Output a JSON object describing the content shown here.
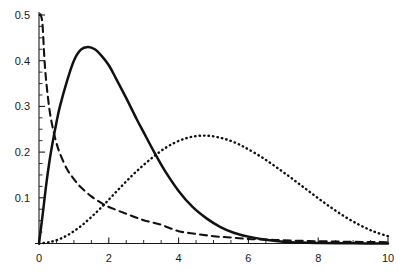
{
  "chart_data": {
    "type": "line",
    "title": "",
    "subtitle": "",
    "xlabel": "",
    "ylabel": "",
    "xlim": [
      0,
      10
    ],
    "ylim": [
      0,
      0.5
    ],
    "grid": false,
    "legend": "none",
    "x_ticks": [
      0,
      2,
      4,
      6,
      8,
      10
    ],
    "x_tick_labels": [
      "0",
      "2",
      "4",
      "6",
      "8",
      "10"
    ],
    "x_minor_step": 0.5,
    "y_ticks": [
      0.1,
      0.2,
      0.3,
      0.4,
      0.5
    ],
    "y_tick_labels": [
      "0.1",
      "0.2",
      "0.3",
      "0.4",
      "0.5"
    ],
    "y_minor_step": 0.025,
    "series": [
      {
        "name": "chi-squared k=1",
        "style": "dashed",
        "color": "#111111",
        "x": [
          0.02,
          0.05,
          0.1,
          0.15,
          0.2,
          0.3,
          0.4,
          0.5,
          0.6,
          0.8,
          1.0,
          1.2,
          1.5,
          1.8,
          2.0,
          2.5,
          3.0,
          3.5,
          4.0,
          4.5,
          5.0,
          5.5,
          6.0,
          6.5,
          7.0,
          7.5,
          8.0,
          8.5,
          9.0,
          9.5,
          10.0
        ],
        "y": [
          0.5,
          0.5,
          0.48,
          0.411,
          0.36,
          0.293,
          0.251,
          0.22,
          0.197,
          0.163,
          0.141,
          0.123,
          0.103,
          0.088,
          0.08,
          0.065,
          0.051,
          0.041,
          0.027,
          0.021,
          0.016,
          0.013,
          0.01,
          0.0085,
          0.007,
          0.0058,
          0.0049,
          0.0042,
          0.0036,
          0.0031,
          0.0028
        ]
      },
      {
        "name": "chi-squared k=3 (scaled)",
        "style": "solid",
        "color": "#111111",
        "x": [
          0.0,
          0.1,
          0.2,
          0.3,
          0.4,
          0.5,
          0.6,
          0.8,
          1.0,
          1.2,
          1.4,
          1.6,
          1.8,
          2.0,
          2.2,
          2.5,
          2.8,
          3.0,
          3.3,
          3.6,
          4.0,
          4.4,
          4.8,
          5.2,
          5.6,
          6.0,
          6.5,
          7.0,
          7.5,
          8.0,
          9.0,
          10.0
        ],
        "y": [
          0.0,
          0.06,
          0.125,
          0.18,
          0.225,
          0.265,
          0.3,
          0.355,
          0.4,
          0.424,
          0.43,
          0.425,
          0.41,
          0.39,
          0.362,
          0.318,
          0.272,
          0.243,
          0.2,
          0.16,
          0.115,
          0.08,
          0.055,
          0.036,
          0.023,
          0.015,
          0.008,
          0.004,
          0.002,
          0.0012,
          0.0004,
          0.0001
        ]
      },
      {
        "name": "chi-squared k=5 (scaled)",
        "style": "dotted",
        "color": "#111111",
        "x": [
          0.0,
          0.3,
          0.6,
          0.9,
          1.2,
          1.5,
          1.8,
          2.1,
          2.4,
          2.7,
          3.0,
          3.3,
          3.6,
          3.9,
          4.2,
          4.5,
          4.8,
          5.1,
          5.4,
          5.7,
          6.0,
          6.4,
          6.8,
          7.2,
          7.6,
          8.0,
          8.4,
          8.8,
          9.2,
          9.6,
          10.0
        ],
        "y": [
          0.0,
          0.003,
          0.01,
          0.022,
          0.038,
          0.058,
          0.08,
          0.104,
          0.128,
          0.151,
          0.172,
          0.191,
          0.208,
          0.221,
          0.23,
          0.235,
          0.236,
          0.233,
          0.227,
          0.218,
          0.206,
          0.188,
          0.167,
          0.145,
          0.122,
          0.099,
          0.077,
          0.057,
          0.04,
          0.026,
          0.016
        ]
      }
    ]
  },
  "axes": {
    "x_axis_name": "x-axis",
    "y_axis_name": "y-axis"
  },
  "colors": {
    "ink": "#111111",
    "background": "#ffffff"
  }
}
